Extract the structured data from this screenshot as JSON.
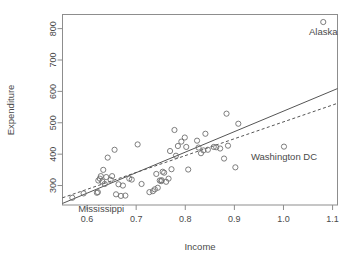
{
  "chart_data": {
    "type": "scatter",
    "title": "",
    "xlabel": "Income",
    "ylabel": "Expenditure",
    "xlim": [
      0.55,
      1.11
    ],
    "ylim": [
      238,
      845
    ],
    "grid": false,
    "legend": "none",
    "x_ticks": [
      "0.6",
      "0.7",
      "0.8",
      "0.9",
      "1.0",
      "1.1"
    ],
    "x_tick_values": [
      0.6,
      0.7,
      0.8,
      0.9,
      1.0,
      1.1
    ],
    "y_ticks": [
      "300",
      "400",
      "500",
      "600",
      "700",
      "800"
    ],
    "y_tick_values": [
      300,
      400,
      500,
      600,
      700,
      800
    ],
    "marker": "open-circle",
    "points": [
      {
        "x": 0.57,
        "y": 261
      },
      {
        "x": 0.593,
        "y": 275
      },
      {
        "x": 0.62,
        "y": 277
      },
      {
        "x": 0.622,
        "y": 279
      },
      {
        "x": 0.623,
        "y": 316
      },
      {
        "x": 0.626,
        "y": 322
      },
      {
        "x": 0.628,
        "y": 330
      },
      {
        "x": 0.631,
        "y": 313
      },
      {
        "x": 0.633,
        "y": 350
      },
      {
        "x": 0.636,
        "y": 305
      },
      {
        "x": 0.639,
        "y": 327
      },
      {
        "x": 0.642,
        "y": 389
      },
      {
        "x": 0.648,
        "y": 318
      },
      {
        "x": 0.651,
        "y": 330
      },
      {
        "x": 0.656,
        "y": 414
      },
      {
        "x": 0.659,
        "y": 272
      },
      {
        "x": 0.664,
        "y": 304
      },
      {
        "x": 0.669,
        "y": 267
      },
      {
        "x": 0.673,
        "y": 300
      },
      {
        "x": 0.678,
        "y": 268
      },
      {
        "x": 0.686,
        "y": 322
      },
      {
        "x": 0.691,
        "y": 319
      },
      {
        "x": 0.703,
        "y": 431
      },
      {
        "x": 0.711,
        "y": 305
      },
      {
        "x": 0.727,
        "y": 279
      },
      {
        "x": 0.734,
        "y": 282
      },
      {
        "x": 0.738,
        "y": 288
      },
      {
        "x": 0.741,
        "y": 337
      },
      {
        "x": 0.744,
        "y": 293
      },
      {
        "x": 0.748,
        "y": 316
      },
      {
        "x": 0.751,
        "y": 314
      },
      {
        "x": 0.752,
        "y": 317
      },
      {
        "x": 0.754,
        "y": 344
      },
      {
        "x": 0.757,
        "y": 341
      },
      {
        "x": 0.761,
        "y": 312
      },
      {
        "x": 0.766,
        "y": 322
      },
      {
        "x": 0.769,
        "y": 410
      },
      {
        "x": 0.772,
        "y": 352
      },
      {
        "x": 0.778,
        "y": 477
      },
      {
        "x": 0.781,
        "y": 395
      },
      {
        "x": 0.785,
        "y": 426
      },
      {
        "x": 0.792,
        "y": 440
      },
      {
        "x": 0.799,
        "y": 453
      },
      {
        "x": 0.802,
        "y": 423
      },
      {
        "x": 0.806,
        "y": 351
      },
      {
        "x": 0.824,
        "y": 443
      },
      {
        "x": 0.827,
        "y": 421
      },
      {
        "x": 0.832,
        "y": 403
      },
      {
        "x": 0.837,
        "y": 412
      },
      {
        "x": 0.841,
        "y": 465
      },
      {
        "x": 0.846,
        "y": 414
      },
      {
        "x": 0.858,
        "y": 423
      },
      {
        "x": 0.863,
        "y": 422
      },
      {
        "x": 0.871,
        "y": 418
      },
      {
        "x": 0.879,
        "y": 386
      },
      {
        "x": 0.884,
        "y": 529
      },
      {
        "x": 0.887,
        "y": 427
      },
      {
        "x": 0.902,
        "y": 358
      },
      {
        "x": 0.908,
        "y": 497
      },
      {
        "x": 1.001,
        "y": 424
      },
      {
        "x": 1.081,
        "y": 821
      }
    ],
    "annotations": [
      {
        "name": "Mississippi",
        "label": "Mississippi",
        "x": 0.57,
        "y": 261,
        "placement": "below-left"
      },
      {
        "name": "Washington DC",
        "label": "Washington DC",
        "x": 1.001,
        "y": 424,
        "placement": "below"
      },
      {
        "name": "Alaska",
        "label": "Alaska",
        "x": 1.081,
        "y": 821,
        "placement": "below"
      }
    ],
    "lines": [
      {
        "name": "ols-fit",
        "style": "solid",
        "x_start": 0.55,
        "y_start": 243,
        "x_end": 1.11,
        "y_end": 609
      },
      {
        "name": "robust-fit",
        "style": "dashed",
        "x_start": 0.55,
        "y_start": 261,
        "x_end": 1.11,
        "y_end": 562
      }
    ]
  },
  "colors": {
    "frame": "#8d8d8d",
    "point": "#6f6f6f",
    "line": "#555555",
    "text": "#4a4a4a",
    "background": "#ffffff"
  }
}
